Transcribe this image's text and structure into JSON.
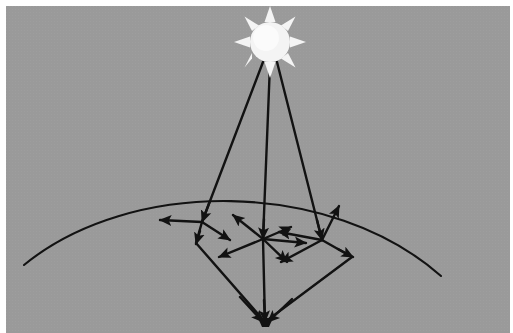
{
  "figure": {
    "title": "Solar radiative transfer and multiple scattering in the atmosphere",
    "width": 513,
    "height": 333,
    "background_color": "#9a9a9a",
    "stroke_color": "#121212",
    "sun_fill_color": "#f2f2f2",
    "canvas_margin_color": "#ffffff"
  },
  "elements": {
    "sun": {
      "label": "sun",
      "center_x": 270,
      "center_y": 42,
      "radius": 20,
      "ray_count": 8,
      "ray_length": 13,
      "fill": "#f4f4f4"
    },
    "horizon_curve": {
      "label": "atmosphere-surface-curve",
      "start": [
        24,
        265
      ],
      "control_1": [
        130,
        178
      ],
      "control_2": [
        330,
        178
      ],
      "end": [
        441,
        276
      ],
      "stroke_width": 2.1
    },
    "sensor": {
      "label": "ground-sensor",
      "x": 265,
      "y": 322,
      "size": 7
    },
    "incident_rays": [
      {
        "name": "incident-ray-left",
        "from": [
          263,
          62
        ],
        "to": [
          202,
          222
        ]
      },
      {
        "name": "incident-ray-center",
        "from": [
          270,
          64
        ],
        "to": [
          263,
          239
        ]
      },
      {
        "name": "incident-ray-right",
        "from": [
          277,
          62
        ],
        "to": [
          322,
          240
        ]
      }
    ],
    "scatter_nodes": [
      {
        "name": "scatter-node-left",
        "x": 202,
        "y": 222,
        "scatter_arrows": [
          {
            "dx": -42,
            "dy": -2
          },
          {
            "dx": 28,
            "dy": 18
          }
        ],
        "return_path": {
          "to": [
            265,
            322
          ],
          "via": [
            196,
            243
          ]
        }
      },
      {
        "name": "scatter-node-center",
        "x": 263,
        "y": 239,
        "scatter_arrows": [
          {
            "dx": -30,
            "dy": -24
          },
          {
            "dx": 28,
            "dy": -12
          },
          {
            "dx": 43,
            "dy": 4
          },
          {
            "dx": 24,
            "dy": 23
          },
          {
            "dx": -44,
            "dy": 18
          }
        ],
        "return_path": {
          "to": [
            265,
            322
          ],
          "via": [
            263,
            239
          ]
        }
      },
      {
        "name": "scatter-node-right",
        "x": 322,
        "y": 240,
        "scatter_arrows": [
          {
            "dx": 17,
            "dy": -34
          },
          {
            "dx": -43,
            "dy": -8
          },
          {
            "dx": -41,
            "dy": 22
          }
        ],
        "return_path": {
          "to": [
            265,
            322
          ],
          "via": [
            352,
            257
          ]
        }
      }
    ],
    "scattered_to_sensor_paths": [
      {
        "name": "scattered-path-left",
        "points": [
          [
            202,
            222
          ],
          [
            196,
            243
          ],
          [
            265,
            322
          ]
        ]
      },
      {
        "name": "scattered-path-center",
        "points": [
          [
            263,
            239
          ],
          [
            265,
            322
          ]
        ]
      },
      {
        "name": "scattered-path-right",
        "points": [
          [
            322,
            240
          ],
          [
            352,
            257
          ],
          [
            265,
            322
          ]
        ]
      }
    ]
  }
}
